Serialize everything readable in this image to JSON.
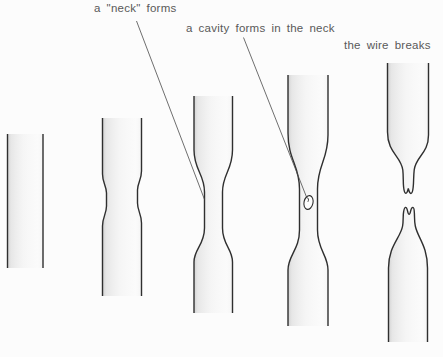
{
  "figure": {
    "background_color": "#fcfcfc",
    "line_color": "#2f2f2f",
    "leader_line_color": "#4a4a4a",
    "text_color": "#595959",
    "labels": {
      "neck_forms": "a \"neck\" forms",
      "cavity_forms": "a cavity forms in the neck",
      "wire_breaks": "the wire breaks"
    }
  }
}
